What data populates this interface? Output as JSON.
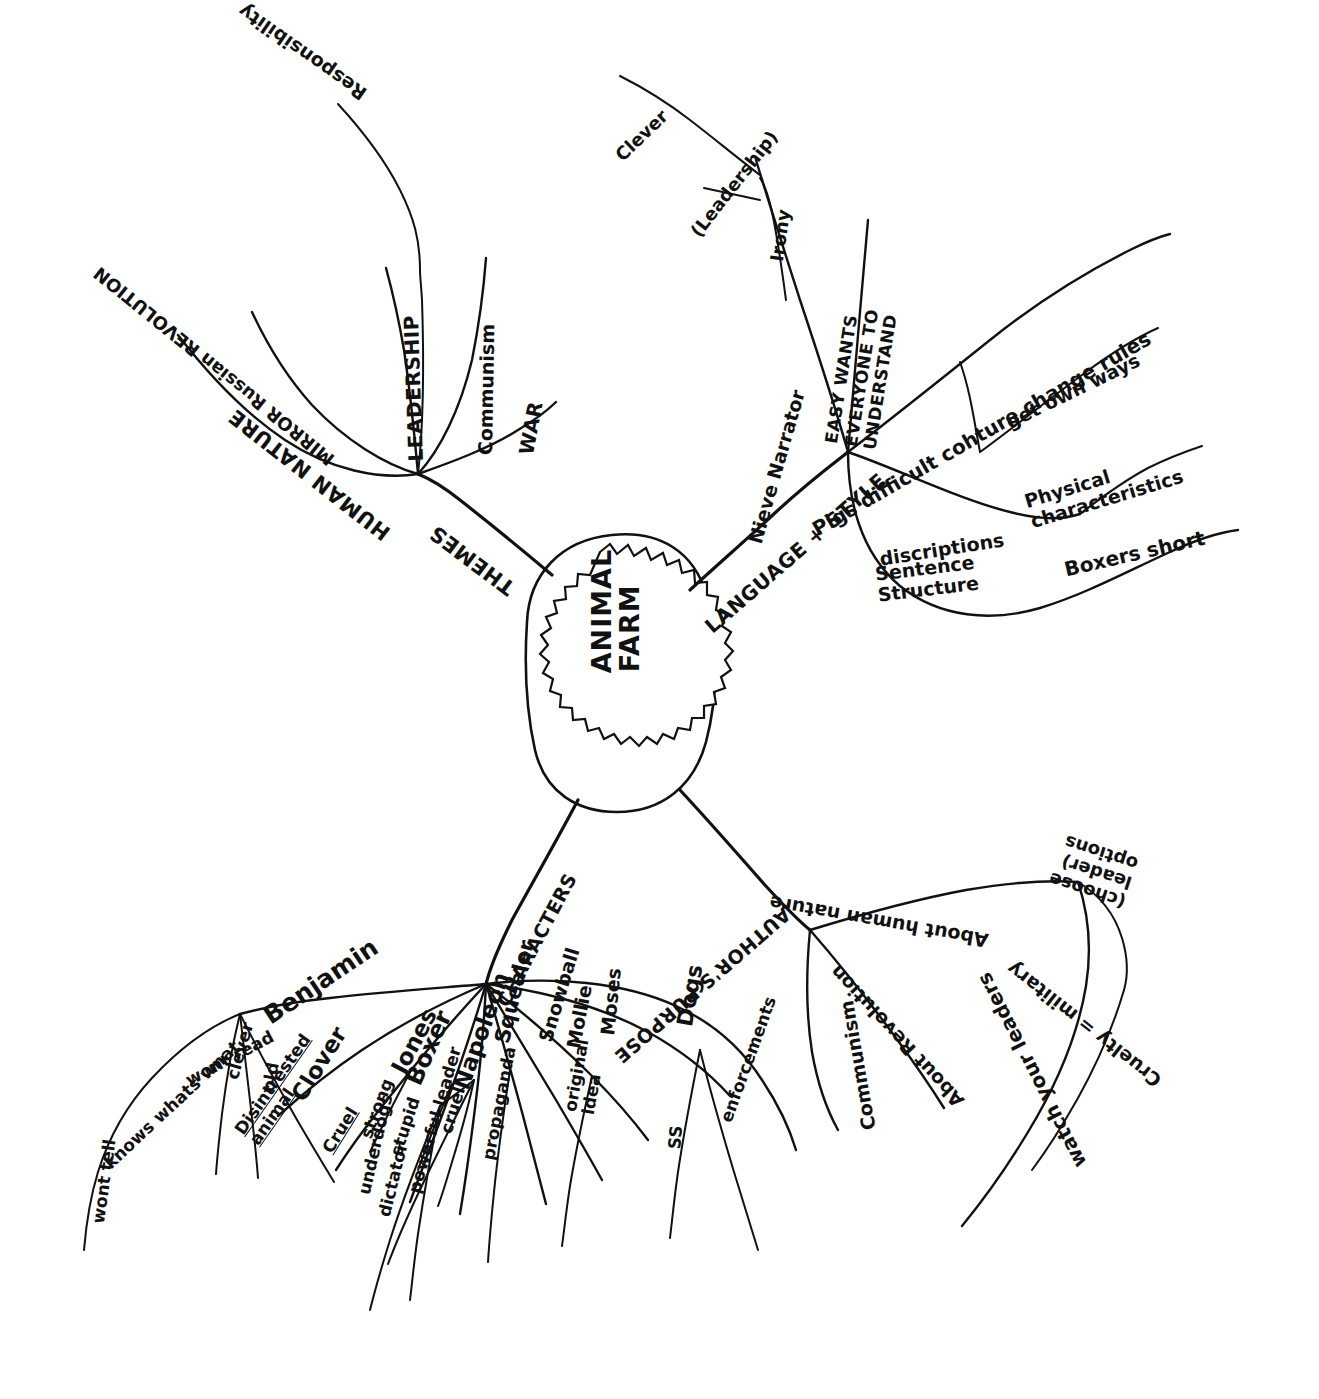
{
  "center": {
    "line1": "ANIMAL",
    "line2": "FARM"
  },
  "branches": {
    "themes": {
      "label": "THEMES",
      "children": [
        {
          "label": "HUMAN NATURE"
        },
        {
          "label": "MIRROR Russian REVOLUTION"
        },
        {
          "label": "LEADERSHIP",
          "children": [
            {
              "label": "Responsibility"
            }
          ]
        },
        {
          "label": "Communism"
        },
        {
          "label": "WAR"
        }
      ]
    },
    "language": {
      "label": "LANGUAGE + STYLE",
      "children": [
        {
          "label": "Nieve Narrator",
          "children": [
            {
              "label": "Clever"
            },
            {
              "label": "(Leadership)"
            },
            {
              "label": "Irony"
            }
          ]
        },
        {
          "label": "EASY WANTS EVERYONE TO UNDERSTAND"
        },
        {
          "label": "Pigs difficult cohture change rules",
          "children": [
            {
              "label": "get own ways"
            }
          ]
        },
        {
          "label": "discriptions",
          "children": [
            {
              "label": "Physical characteristics"
            }
          ]
        },
        {
          "label": "Sentence Structure",
          "children": [
            {
              "label": "Boxers short"
            }
          ]
        }
      ]
    },
    "purpose": {
      "label": "AUTHOR'S PURPOSE",
      "children": [
        {
          "label": "Communism"
        },
        {
          "label": "About Revolution"
        },
        {
          "label": "About human nature",
          "children": [
            {
              "label": "(choose leader) options"
            },
            {
              "label": "Cruelty = military"
            },
            {
              "label": "watch your leaders"
            }
          ]
        }
      ]
    },
    "characters": {
      "label": "CHARACTERS",
      "children": [
        {
          "label": "Benjamin",
          "children": [
            {
              "label": "wont read",
              "children": [
                {
                  "label": "knows whats wnat",
                  "children": [
                    {
                      "label": "wont tell"
                    }
                  ]
                }
              ]
            },
            {
              "label": "clever"
            },
            {
              "label": "old"
            },
            {
              "label": "Disintrested animal"
            }
          ]
        },
        {
          "label": "Clover"
        },
        {
          "label": "Jones",
          "children": [
            {
              "label": "Cruel"
            }
          ]
        },
        {
          "label": "Boxer",
          "children": [
            {
              "label": "strong"
            },
            {
              "label": "stupid"
            }
          ]
        },
        {
          "label": "Napoleon",
          "children": [
            {
              "label": "powerful leader"
            },
            {
              "label": "dictator"
            },
            {
              "label": "underdogs"
            },
            {
              "label": "cruel"
            }
          ]
        },
        {
          "label": "Squealer",
          "children": [
            {
              "label": "propaganda"
            }
          ]
        },
        {
          "label": "Snowball"
        },
        {
          "label": "Moses",
          "children": [
            {
              "label": "original idea"
            }
          ]
        },
        {
          "label": "Mollie"
        },
        {
          "label": "Dogs",
          "children": [
            {
              "label": "SS"
            },
            {
              "label": "enforcements"
            }
          ]
        }
      ]
    }
  },
  "colors": {
    "ink": "#111111",
    "paper": "#ffffff"
  }
}
